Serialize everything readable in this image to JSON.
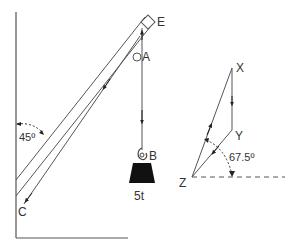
{
  "diagram": {
    "type": "crane jib force diagram",
    "colors": {
      "line": "#555555",
      "text": "#333333",
      "weight": "#111111",
      "background": "#ffffff"
    },
    "labels": {
      "point_e": "E",
      "point_a": "A",
      "point_b": "B",
      "point_c": "C",
      "load": "5t",
      "jib_angle": "45º"
    },
    "force_triangle": {
      "vertex_x": "X",
      "vertex_y": "Y",
      "vertex_z": "Z",
      "angle": "67.5º"
    }
  }
}
